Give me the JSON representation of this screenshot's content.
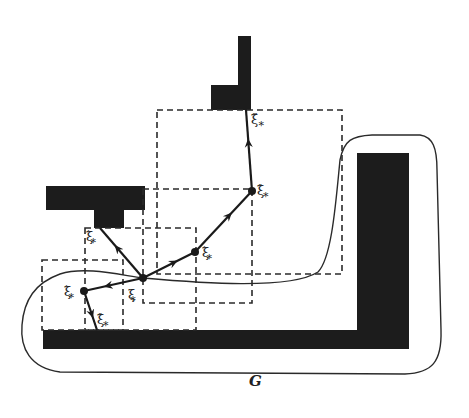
{
  "diagram": {
    "region_label": "G",
    "colors": {
      "obstacle": "#1c1c1c",
      "line": "#2a2a2a",
      "background": "#ffffff"
    },
    "obstacles": [
      {
        "name": "top-l-vertical",
        "x": 238,
        "y": 36,
        "w": 13,
        "h": 74
      },
      {
        "name": "top-l-base",
        "x": 211,
        "y": 85,
        "w": 40,
        "h": 25
      },
      {
        "name": "t-top-bar",
        "x": 46,
        "y": 186,
        "w": 99,
        "h": 24
      },
      {
        "name": "t-stem",
        "x": 94,
        "y": 208,
        "w": 30,
        "h": 20
      },
      {
        "name": "bottom-bar",
        "x": 43,
        "y": 330,
        "w": 366,
        "h": 19
      },
      {
        "name": "right-bar",
        "x": 357,
        "y": 153,
        "w": 52,
        "h": 196
      }
    ],
    "dashed_boxes": [
      {
        "name": "box-xi-star",
        "x": 85,
        "y": 228,
        "w": 111,
        "h": 102
      },
      {
        "name": "box-xi-prime-right",
        "x": 143,
        "y": 189,
        "w": 109,
        "h": 114
      },
      {
        "name": "box-xi-double-prime",
        "x": 157,
        "y": 110,
        "w": 185,
        "h": 164
      },
      {
        "name": "box-xi-prime-left",
        "x": 42,
        "y": 260,
        "w": 81,
        "h": 70
      }
    ],
    "nodes": [
      {
        "name": "xi-star",
        "x": 143,
        "y": 278
      },
      {
        "name": "xi-prime-right",
        "x": 195,
        "y": 252
      },
      {
        "name": "xi-double-prime-top",
        "x": 252,
        "y": 191
      },
      {
        "name": "xi-prime-left",
        "x": 84,
        "y": 291
      }
    ],
    "segments": [
      {
        "from": [
          143,
          278
        ],
        "to": [
          195,
          252
        ],
        "arrow": true
      },
      {
        "from": [
          195,
          252
        ],
        "to": [
          252,
          191
        ],
        "arrow": true
      },
      {
        "from": [
          252,
          191
        ],
        "to": [
          246,
          110
        ],
        "arrow": true
      },
      {
        "from": [
          143,
          278
        ],
        "to": [
          100,
          228
        ],
        "arrow": true
      },
      {
        "from": [
          143,
          278
        ],
        "to": [
          84,
          291
        ],
        "arrow": true
      },
      {
        "from": [
          84,
          291
        ],
        "to": [
          97,
          330
        ],
        "arrow": true
      }
    ],
    "labels": [
      {
        "name": "label-xi-star",
        "base": "ξ",
        "sub": "*",
        "prime": "",
        "x": 128,
        "y": 288
      },
      {
        "name": "label-xi-prime-right",
        "base": "ξ",
        "sub": "*",
        "prime": "′",
        "x": 202,
        "y": 246
      },
      {
        "name": "label-xi-double-prime-top",
        "base": "ξ",
        "sub": "*",
        "prime": "″",
        "x": 257,
        "y": 184
      },
      {
        "name": "label-xi-triple-prime",
        "base": "ξ",
        "sub": "*",
        "prime": "‴",
        "x": 251,
        "y": 113
      },
      {
        "name": "label-xi-prime-upper-left",
        "base": "ξ",
        "sub": "*",
        "prime": "′",
        "x": 86,
        "y": 230
      },
      {
        "name": "label-xi-prime-left",
        "base": "ξ",
        "sub": "*",
        "prime": "′",
        "x": 64,
        "y": 285
      },
      {
        "name": "label-xi-double-prime-bottom",
        "base": "ξ",
        "sub": "*",
        "prime": "″",
        "x": 97,
        "y": 313
      }
    ]
  }
}
